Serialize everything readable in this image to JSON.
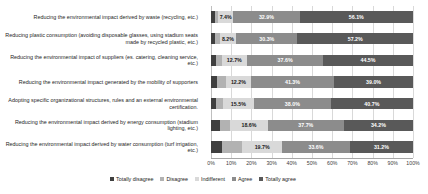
{
  "chart_data": {
    "type": "bar",
    "title": "",
    "xlabel": "",
    "ylabel": "",
    "orientation": "horizontal",
    "stacked": true,
    "stack_mode": "percent",
    "xlim": [
      0,
      100
    ],
    "grid": true,
    "legend_position": "bottom",
    "xticks": [
      "0%",
      "10%",
      "20%",
      "30%",
      "40%",
      "50%",
      "60%",
      "70%",
      "80%",
      "90%",
      "100%"
    ],
    "xtick_values": [
      0,
      10,
      20,
      30,
      40,
      50,
      60,
      70,
      80,
      90,
      100
    ],
    "categories": [
      "Reducing the environmental impact derived by waste (recycling, etc.)",
      "Reducing plastic consumption (avoiding disposable glasses, using stadium seats made by recycled plastic, etc.)",
      "Reducing the environmental impact of suppliers (es. catering, cleaning service, etc.)",
      "Reducing the environmental impact generated by the mobility of supporters",
      "Adopting specific organizational structures, rules and an external environmental certification.",
      "Reducing the environmental impact derived by energy consumption (stadium lighting, etc.)",
      "Reducing the environmental impact derived by water consumption (turf irrigation, etc.)"
    ],
    "series": [
      {
        "name": "Totally disagree",
        "color": "#3f3f3f",
        "values": [
          1.8,
          1.9,
          2.6,
          2.9,
          2.7,
          4.3,
          5.6
        ],
        "labels": [
          "",
          "",
          "",
          "",
          "",
          "",
          ""
        ]
      },
      {
        "name": "Disagree",
        "color": "#b2b2b2",
        "values": [
          1.8,
          2.4,
          2.6,
          4.6,
          3.1,
          5.2,
          9.9
        ],
        "labels": [
          "",
          "",
          "",
          "",
          "",
          "",
          ""
        ]
      },
      {
        "name": "Indifferent",
        "color": "#d9d9d9",
        "values": [
          7.4,
          8.2,
          12.7,
          12.2,
          15.5,
          18.6,
          19.7
        ],
        "labels": [
          "7.4%",
          "8.2%",
          "12.7%",
          "12.2%",
          "15.5%",
          "18.6%",
          "19.7%"
        ]
      },
      {
        "name": "Agree",
        "color": "#8c8c8c",
        "values": [
          32.9,
          30.3,
          37.6,
          41.3,
          38.0,
          37.7,
          33.6
        ],
        "labels": [
          "32.9%",
          "30.3%",
          "37.6%",
          "41.3%",
          "38.0%",
          "37.7%",
          "33.6%"
        ]
      },
      {
        "name": "Totally agree",
        "color": "#595959",
        "values": [
          56.1,
          57.2,
          44.5,
          39.0,
          40.7,
          34.2,
          31.2
        ],
        "labels": [
          "56.1%",
          "57.2%",
          "44.5%",
          "39.0%",
          "40.7%",
          "34.2%",
          "31.2%"
        ]
      }
    ]
  }
}
